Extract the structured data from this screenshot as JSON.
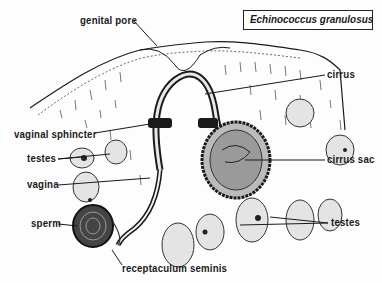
{
  "diagram": {
    "title": "Echinococcus granulosus",
    "labels": {
      "genital_pore": "genital pore",
      "cirrus": "cirrus",
      "vaginal_sphincter": "vaginal sphincter",
      "testes_left": "testes",
      "vagina": "vagina",
      "cirrus_sac": "cirrus sac",
      "sperm": "sperm",
      "testes_right": "testes",
      "receptaculum_seminis": "receptaculum seminis"
    },
    "colors": {
      "ink": "#1a1a1a",
      "background": "#fdfdfd",
      "stipple": "#555555"
    }
  }
}
